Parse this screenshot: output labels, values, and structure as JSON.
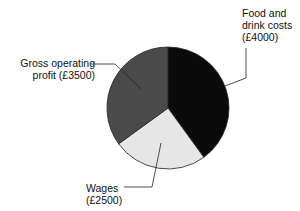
{
  "chart_data": {
    "type": "pie",
    "title": "",
    "categories": [
      "Food and drink costs",
      "Wages",
      "Gross operating profit"
    ],
    "values": [
      4000,
      2500,
      3500
    ],
    "currency": "£",
    "colors": [
      "#0a0a0a",
      "#e6e6e6",
      "#4a4a4a"
    ],
    "start_angle_deg": 0,
    "direction": "clockwise",
    "legend": "none",
    "labels_with_leader_lines": true
  },
  "labels": {
    "food": {
      "line1": "Food and",
      "line2": "drink costs",
      "line3": "(£4000)"
    },
    "gross": {
      "line1": "Gross operating",
      "line2": "profit (£3500)"
    },
    "wages": {
      "line1": "Wages",
      "line2": "(£2500)"
    }
  }
}
